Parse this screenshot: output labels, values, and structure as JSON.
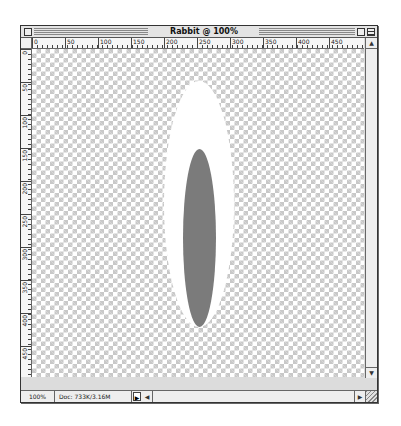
{
  "window": {
    "title": "Rabbit @ 100% (Ears,RGB)",
    "close_icon": "close-box-icon",
    "zoom_icon": "zoom-box-icon",
    "collapse_icon": "collapse-box-icon"
  },
  "rulers": {
    "horizontal": [
      "0",
      "50",
      "100",
      "150",
      "200",
      "250",
      "300",
      "350",
      "400",
      "450"
    ],
    "vertical": [
      "0",
      "50",
      "100",
      "150",
      "200",
      "250",
      "300",
      "350",
      "400",
      "450"
    ],
    "units_px_per_label": 50
  },
  "canvas": {
    "background": "transparent-checkerboard",
    "shapes": [
      {
        "type": "ellipse",
        "fill": "#ffffff",
        "name": "outer-ear"
      },
      {
        "type": "ellipse",
        "fill": "#7b7b7b",
        "name": "inner-ear"
      }
    ]
  },
  "statusbar": {
    "zoom_level": "100%",
    "doc_info": "Doc: 733K/3.16M",
    "popup_arrow": "▶",
    "scroll_left": "◀",
    "scroll_right": "▶"
  },
  "scrollbar": {
    "up_arrow": "▲",
    "down_arrow": "▼"
  }
}
